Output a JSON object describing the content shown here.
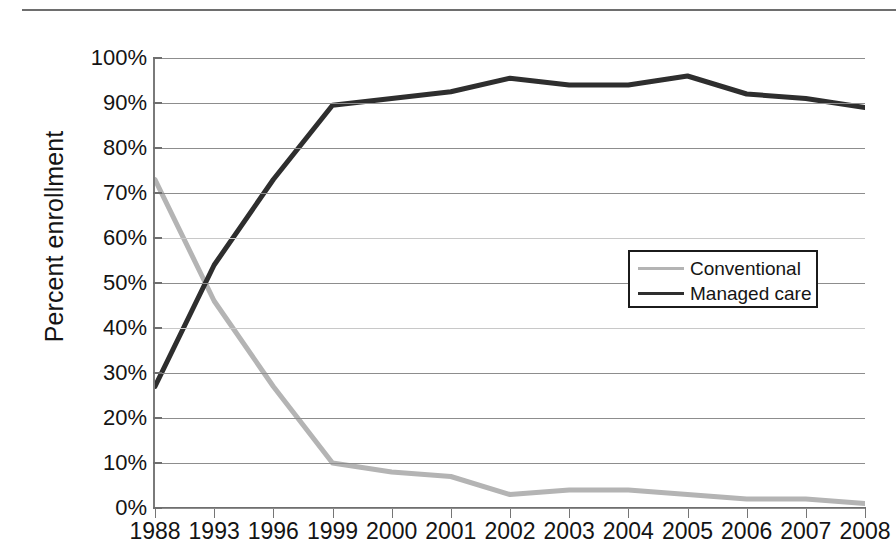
{
  "chart_data": {
    "type": "line",
    "title": "",
    "xlabel": "",
    "ylabel": "Percent enrollment",
    "categories": [
      "1988",
      "1993",
      "1996",
      "1999",
      "2000",
      "2001",
      "2002",
      "2003",
      "2004",
      "2005",
      "2006",
      "2007",
      "2008"
    ],
    "ylim": [
      0,
      100
    ],
    "ytick_labels": [
      "0%",
      "10%",
      "20%",
      "30%",
      "40%",
      "50%",
      "60%",
      "70%",
      "80%",
      "90%",
      "100%"
    ],
    "ytick_values": [
      0,
      10,
      20,
      30,
      40,
      50,
      60,
      70,
      80,
      90,
      100
    ],
    "grid": true,
    "legend_position": "center-right",
    "series": [
      {
        "name": "Conventional",
        "color": "#b4b4b4",
        "values": [
          73,
          46,
          27,
          10,
          8,
          7,
          3,
          4,
          4,
          3,
          2,
          2,
          1
        ]
      },
      {
        "name": "Managed care",
        "color": "#2e2e2e",
        "values": [
          27,
          54,
          73,
          89.5,
          91,
          92.5,
          95.5,
          94,
          94,
          96,
          92,
          91,
          89
        ]
      }
    ]
  },
  "legend": {
    "items": [
      {
        "label": "Conventional"
      },
      {
        "label": "Managed care"
      }
    ]
  }
}
